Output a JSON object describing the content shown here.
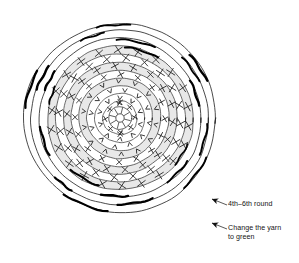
{
  "document": {
    "title": "Crochet round chart",
    "background_color": "#ffffff",
    "ink_color": "#1a1a1a"
  },
  "diagram": {
    "name": "crochet-circle-chart",
    "type": "concentric-round-stitch-chart",
    "center": {
      "x": 120,
      "y": 118
    },
    "outer_radius": 96,
    "shading_color": "#e8e8e8",
    "line_color": "#2b2b2b",
    "accent_color": "#000000",
    "core": {
      "label": "magic-ring-center",
      "inner_radius": 4.2,
      "hub_radius": 11.5,
      "spokes": 8
    },
    "rings": [
      {
        "index": 1,
        "radius": 17,
        "symbol": "x",
        "count": 8,
        "shaded": false,
        "accents": 0
      },
      {
        "index": 2,
        "radius": 25,
        "symbol": "v",
        "count": 10,
        "shaded": false,
        "accents": 0
      },
      {
        "index": 3,
        "radius": 33,
        "symbol": "v",
        "count": 12,
        "shaded": false,
        "accents": 0
      },
      {
        "index": 4,
        "radius": 41,
        "symbol": "v",
        "count": 14,
        "shaded": true,
        "accents": 0
      },
      {
        "index": 5,
        "radius": 49,
        "symbol": "x",
        "count": 16,
        "shaded": false,
        "accents": 0
      },
      {
        "index": 6,
        "radius": 57,
        "symbol": "x",
        "count": 18,
        "shaded": true,
        "accents": 0
      },
      {
        "index": 7,
        "radius": 65,
        "symbol": "x",
        "count": 20,
        "shaded": false,
        "accents": 0
      },
      {
        "index": 8,
        "radius": 73,
        "symbol": "x",
        "count": 22,
        "shaded": true,
        "accents": 4
      },
      {
        "index": 9,
        "radius": 81,
        "symbol": "none",
        "count": 0,
        "shaded": false,
        "accents": 6
      },
      {
        "index": 10,
        "radius": 89,
        "symbol": "none",
        "count": 0,
        "shaded": false,
        "accents": 6
      },
      {
        "index": 11,
        "radius": 96,
        "symbol": "none",
        "count": 0,
        "shaded": false,
        "accents": 5
      }
    ],
    "symbol_legend": {
      "x": "single-crochet-stitch",
      "v": "increase-stitch"
    }
  },
  "annotations": [
    {
      "id": "round-range",
      "text": "4th–6th round",
      "arrow": {
        "tip_x": 212,
        "tip_y": 199,
        "tail_x": 227,
        "tail_y": 205
      }
    },
    {
      "id": "yarn-change",
      "text": "Change the yarn\nto green",
      "arrow": {
        "tip_x": 212,
        "tip_y": 223,
        "tail_x": 227,
        "tail_y": 229
      }
    }
  ]
}
